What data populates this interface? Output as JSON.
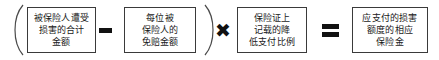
{
  "diagram": {
    "type": "formula",
    "open_paren": "(",
    "close_paren": ")",
    "operators": {
      "minus": "−",
      "times": "✖",
      "equals": "="
    },
    "terms": [
      {
        "id": "total-damage-amount",
        "lines": [
          "被保险人遭受",
          "损害的合计",
          "金额"
        ]
      },
      {
        "id": "per-insured-deductible",
        "lines": [
          "每位被",
          "保险人的",
          "免赔金额"
        ]
      },
      {
        "id": "reduced-payment-ratio",
        "lines": [
          "保险证上",
          "记载的降",
          "低支付比例"
        ]
      },
      {
        "id": "payable-insurance-amount",
        "lines": [
          "应支付的损害",
          "额度的相应",
          "保险金"
        ]
      }
    ]
  },
  "colors": {
    "border": "#3a3a3a",
    "text": "#1a1a1a",
    "operator": "#111111",
    "background": "#ffffff"
  }
}
